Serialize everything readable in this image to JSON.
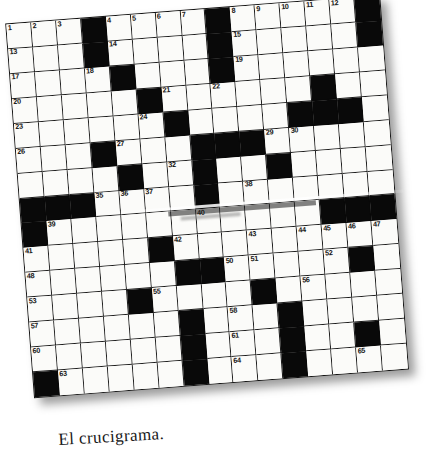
{
  "caption": {
    "text": "El crucigrama."
  },
  "puzzle": {
    "type": "crossword",
    "rows": 15,
    "cols": 15,
    "rotation_deg": -4.4,
    "colors": {
      "block": "#090909",
      "cell": "#fbfbf9",
      "grid_line": "#1a1a1a",
      "number": "#121212",
      "page": "#ffffff"
    },
    "grid": [
      "...#....#.....#",
      "...#....#.....#",
      "....#...#......",
      ".....#......#..",
      "......#....###.",
      "...#...###.....",
      "....#..#..#....",
      "###....#.......",
      "#...........###",
      ".....#.........",
      "......##.....#.",
      "....#....#.....",
      "......#...#....",
      "......#...#..#.",
      "#.....#...#...."
    ],
    "numbers": [
      {
        "n": 1,
        "r": 0,
        "c": 0
      },
      {
        "n": 2,
        "r": 0,
        "c": 1
      },
      {
        "n": 3,
        "r": 0,
        "c": 2
      },
      {
        "n": 4,
        "r": 0,
        "c": 4
      },
      {
        "n": 5,
        "r": 0,
        "c": 5
      },
      {
        "n": 6,
        "r": 0,
        "c": 6
      },
      {
        "n": 7,
        "r": 0,
        "c": 7
      },
      {
        "n": 8,
        "r": 0,
        "c": 9
      },
      {
        "n": 9,
        "r": 0,
        "c": 10
      },
      {
        "n": 10,
        "r": 0,
        "c": 11
      },
      {
        "n": 11,
        "r": 0,
        "c": 12
      },
      {
        "n": 12,
        "r": 0,
        "c": 13
      },
      {
        "n": 13,
        "r": 1,
        "c": 0
      },
      {
        "n": 14,
        "r": 1,
        "c": 4
      },
      {
        "n": 15,
        "r": 1,
        "c": 9
      },
      {
        "n": 16,
        "r": 1,
        "c": 14
      },
      {
        "n": 17,
        "r": 2,
        "c": 0
      },
      {
        "n": 18,
        "r": 2,
        "c": 3
      },
      {
        "n": 19,
        "r": 2,
        "c": 9
      },
      {
        "n": 20,
        "r": 3,
        "c": 0
      },
      {
        "n": 21,
        "r": 3,
        "c": 6
      },
      {
        "n": 22,
        "r": 3,
        "c": 8
      },
      {
        "n": 23,
        "r": 4,
        "c": 0
      },
      {
        "n": 24,
        "r": 4,
        "c": 5
      },
      {
        "n": 25,
        "r": 4,
        "c": 13
      },
      {
        "n": 26,
        "r": 5,
        "c": 0
      },
      {
        "n": 27,
        "r": 5,
        "c": 4
      },
      {
        "n": 28,
        "r": 5,
        "c": 8
      },
      {
        "n": 29,
        "r": 5,
        "c": 10
      },
      {
        "n": 30,
        "r": 5,
        "c": 11
      },
      {
        "n": 31,
        "r": 6,
        "c": 4
      },
      {
        "n": 32,
        "r": 6,
        "c": 6
      },
      {
        "n": 33,
        "r": 6,
        "c": 7
      },
      {
        "n": 34,
        "r": 6,
        "c": 10
      },
      {
        "n": 35,
        "r": 7,
        "c": 3
      },
      {
        "n": 36,
        "r": 7,
        "c": 4
      },
      {
        "n": 37,
        "r": 7,
        "c": 5
      },
      {
        "n": 38,
        "r": 7,
        "c": 9
      },
      {
        "n": 39,
        "r": 8,
        "c": 1
      },
      {
        "n": 40,
        "r": 8,
        "c": 7
      },
      {
        "n": 41,
        "r": 9,
        "c": 0
      },
      {
        "n": 42,
        "r": 9,
        "c": 6
      },
      {
        "n": 43,
        "r": 9,
        "c": 9
      },
      {
        "n": 44,
        "r": 9,
        "c": 11
      },
      {
        "n": 45,
        "r": 9,
        "c": 12
      },
      {
        "n": 46,
        "r": 9,
        "c": 13
      },
      {
        "n": 47,
        "r": 9,
        "c": 14
      },
      {
        "n": 48,
        "r": 10,
        "c": 0
      },
      {
        "n": 49,
        "r": 10,
        "c": 6
      },
      {
        "n": 50,
        "r": 10,
        "c": 8
      },
      {
        "n": 51,
        "r": 10,
        "c": 9
      },
      {
        "n": 52,
        "r": 10,
        "c": 12
      },
      {
        "n": 53,
        "r": 11,
        "c": 0
      },
      {
        "n": 54,
        "r": 11,
        "c": 4
      },
      {
        "n": 55,
        "r": 11,
        "c": 5
      },
      {
        "n": 56,
        "r": 11,
        "c": 11
      },
      {
        "n": 57,
        "r": 12,
        "c": 0
      },
      {
        "n": 58,
        "r": 12,
        "c": 8
      },
      {
        "n": 59,
        "r": 12,
        "c": 10
      },
      {
        "n": 60,
        "r": 13,
        "c": 0
      },
      {
        "n": 61,
        "r": 13,
        "c": 8
      },
      {
        "n": 62,
        "r": 13,
        "c": 13
      },
      {
        "n": 63,
        "r": 14,
        "c": 1
      },
      {
        "n": 64,
        "r": 14,
        "c": 8
      },
      {
        "n": 65,
        "r": 14,
        "c": 13
      }
    ]
  }
}
